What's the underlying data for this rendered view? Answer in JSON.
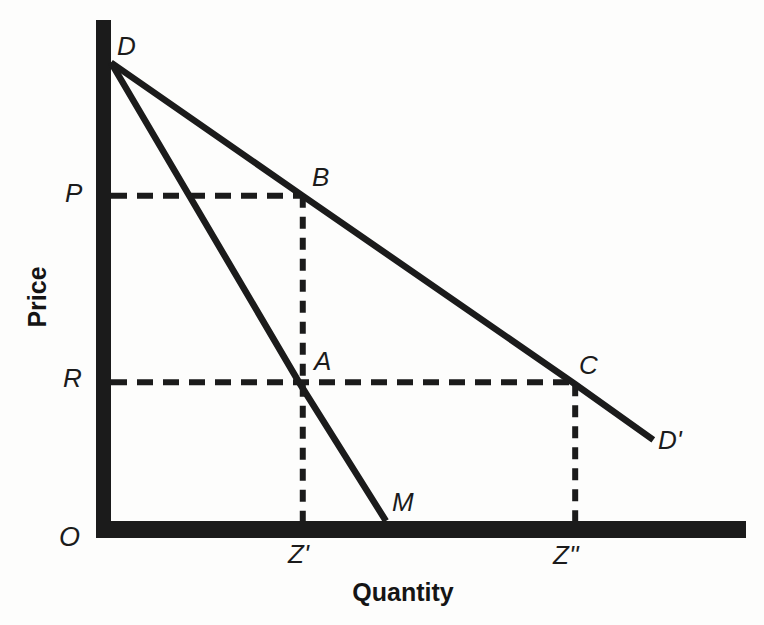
{
  "figure": {
    "background": "#fdfdfc",
    "ink": "#1b1b1b"
  },
  "labels": {
    "y_axis": "Price",
    "x_axis": "Quantity",
    "origin": "O",
    "D": "D",
    "B": "B",
    "A": "A",
    "C": "C",
    "M": "M",
    "D_prime": "D'",
    "P": "P",
    "R": "R",
    "Z_prime": "Z'",
    "Z_double_prime": "Z''"
  },
  "chart_data": {
    "type": "line",
    "title": "",
    "xlabel": "Quantity",
    "ylabel": "Price",
    "xlim": [
      0,
      1
    ],
    "ylim": [
      0,
      1
    ],
    "grid": false,
    "legend": false,
    "axes_numeric": false,
    "series": [
      {
        "name": "DDprime-demand-line",
        "style": "solid",
        "points": [
          {
            "label": "D",
            "x": 0.0,
            "y": 0.915
          },
          {
            "label": "B",
            "x": 0.302,
            "y": 0.649
          },
          {
            "label": "C",
            "x": 0.731,
            "y": 0.273
          },
          {
            "label": "D'",
            "x": 0.854,
            "y": 0.162
          }
        ]
      },
      {
        "name": "DM-line",
        "style": "solid",
        "points": [
          {
            "label": "D",
            "x": 0.0,
            "y": 0.915
          },
          {
            "label": "A",
            "x": 0.296,
            "y": 0.277
          },
          {
            "label": "M",
            "x": 0.433,
            "y": 0.0
          }
        ]
      }
    ],
    "dashed_guides": [
      {
        "name": "P-level-to-B",
        "x1": 0.0,
        "y1": 0.649,
        "x2": 0.302,
        "y2": 0.649
      },
      {
        "name": "R-level-through-A-to-C",
        "x1": 0.0,
        "y1": 0.277,
        "x2": 0.731,
        "y2": 0.277
      },
      {
        "name": "B-down-to-Z-prime",
        "x1": 0.302,
        "y1": 0.649,
        "x2": 0.302,
        "y2": 0.0
      },
      {
        "name": "C-down-to-Z-double-prime",
        "x1": 0.731,
        "y1": 0.273,
        "x2": 0.731,
        "y2": 0.0
      }
    ],
    "axis_value_labels": {
      "y": [
        {
          "label": "P",
          "y": 0.649
        },
        {
          "label": "R",
          "y": 0.277
        }
      ],
      "x": [
        {
          "label": "Z'",
          "x": 0.302
        },
        {
          "label": "Z''",
          "x": 0.731
        }
      ]
    }
  }
}
